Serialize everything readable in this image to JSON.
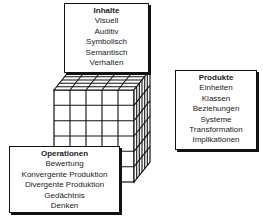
{
  "diagram": {
    "type": "structure-of-intellect-cube",
    "inhalte": {
      "title": "Inhalte",
      "items": [
        "Visuell",
        "Auditiv",
        "Symbolisch",
        "Semantisch",
        "Verhalten"
      ]
    },
    "produkte": {
      "title": "Produkte",
      "items": [
        "Einheiten",
        "Klassen",
        "Beziehungen",
        "Systeme",
        "Transformation",
        "Implikationen"
      ]
    },
    "operationen": {
      "title": "Operationen",
      "items": [
        "Bewertung",
        "Konvergente Produktion",
        "Divergente Produktion",
        "Gedächtnis",
        "Denken"
      ]
    },
    "cube": {
      "front_columns": 5,
      "front_rows": 6,
      "depth_cells": 6,
      "stroke": "#111111"
    }
  }
}
